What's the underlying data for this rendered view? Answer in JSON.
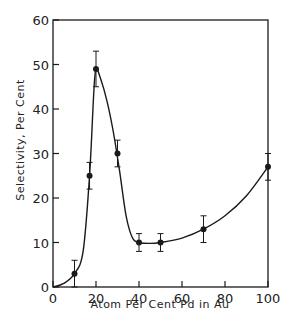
{
  "chart_data": {
    "type": "line",
    "title": "",
    "xlabel": "Atom Per Cent Pd in Au",
    "ylabel": "Selectivity, Per Cent",
    "xlim": [
      0,
      100
    ],
    "ylim": [
      0,
      60
    ],
    "x_ticks": [
      "0",
      "20",
      "40",
      "60",
      "80",
      "100"
    ],
    "y_ticks": [
      "0",
      "10",
      "20",
      "30",
      "40",
      "50",
      "60"
    ],
    "grid": false,
    "legend": null,
    "series": [
      {
        "name": "Selectivity",
        "x": [
          10,
          17,
          20,
          30,
          40,
          50,
          70,
          100
        ],
        "y": [
          3,
          25,
          49,
          30,
          10,
          10,
          13,
          27
        ],
        "error_low": [
          0,
          22,
          45,
          27,
          8,
          8,
          10,
          24
        ],
        "error_high": [
          6,
          28,
          53,
          33,
          12,
          12,
          16,
          30
        ]
      }
    ],
    "fit_curve": {
      "x": [
        0,
        5,
        10,
        14,
        17,
        19,
        20,
        22,
        25,
        28,
        31,
        34,
        37,
        40,
        45,
        50,
        60,
        70,
        80,
        90,
        100
      ],
      "y": [
        0,
        0.8,
        3,
        8,
        25,
        44,
        49,
        47,
        42,
        35,
        26,
        16,
        11,
        10,
        9.8,
        10,
        11,
        13,
        16,
        20.5,
        27
      ]
    }
  }
}
